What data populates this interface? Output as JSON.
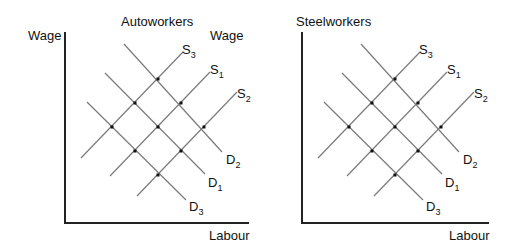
{
  "panels": [
    {
      "title": "Autoworkers",
      "ylabel": "Wage",
      "xlabel": "Labour",
      "supply_labels": {
        "s3": "S",
        "s3_sub": "3",
        "s1": "S",
        "s1_sub": "1",
        "s2": "S",
        "s2_sub": "2"
      },
      "demand_labels": {
        "d2": "D",
        "d2_sub": "2",
        "d1": "D",
        "d1_sub": "1",
        "d3": "D",
        "d3_sub": "3"
      }
    },
    {
      "title": "Steelworkers",
      "ylabel": "Wage",
      "xlabel": "Labour",
      "supply_labels": {
        "s3": "S",
        "s3_sub": "3",
        "s1": "S",
        "s1_sub": "1",
        "s2": "S",
        "s2_sub": "2"
      },
      "demand_labels": {
        "d2": "D",
        "d2_sub": "2",
        "d1": "D",
        "d1_sub": "1",
        "d3": "D",
        "d3_sub": "3"
      }
    }
  ],
  "colors": {
    "curve": "#7a7a7a",
    "axis": "#222222",
    "point": "#111111"
  }
}
